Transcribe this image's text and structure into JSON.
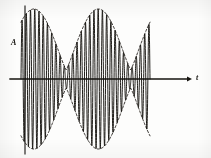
{
  "figure": {
    "kind": "waveform-plot",
    "background_color": "#fdfdfc",
    "ink_color": "#15130f",
    "envelope_color": "#2a2622",
    "width": 211,
    "height": 158
  },
  "axes": {
    "vertical": {
      "label": "A",
      "name": "amplitude-axis",
      "x": 25,
      "y_top": 6,
      "y_bottom": 154,
      "stroke_width": 1.1,
      "has_arrow": false
    },
    "horizontal": {
      "label": "t",
      "name": "time-axis",
      "y": 79,
      "x_start": 10,
      "x_end": 192,
      "stroke_width": 1.4,
      "has_arrow": true,
      "arrow_size": 5
    }
  },
  "chart_data": {
    "type": "line",
    "title": "",
    "subtitle": "",
    "xlabel": "t",
    "ylabel": "A",
    "legend": [],
    "grid": false,
    "xlim": [
      0,
      1
    ],
    "ylim": [
      -1.12,
      1.12
    ],
    "baseline": 0,
    "series": [
      {
        "name": "modulated-carrier",
        "kind": "am-carrier",
        "color": "#15130f",
        "carrier_cycles": 30.5,
        "carrier_phase_deg": 0,
        "envelope_lobes": 2,
        "envelope_min_fraction": 0.13,
        "envelope_peak_fraction": 1.0,
        "x_start_px": 21,
        "x_end_px": 150,
        "samples": 2000
      },
      {
        "name": "upper-envelope",
        "kind": "envelope",
        "color": "#2a2622",
        "dashed": true,
        "dash_pattern": "2.2 2.0",
        "sign": 1
      },
      {
        "name": "lower-envelope",
        "kind": "envelope",
        "color": "#2a2622",
        "dashed": true,
        "dash_pattern": "2.2 2.0",
        "sign": -1
      }
    ],
    "envelope_profile_note": "|cos| shaped envelope: abs(cos(2*pi*x)) floored at 0.13, peaks near x=0.10 and x=0.62, node near x=0.36",
    "annotations": []
  }
}
